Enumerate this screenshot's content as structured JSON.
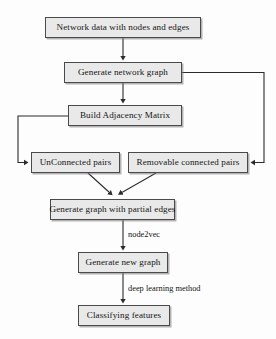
{
  "diagram": {
    "background_color": "#fdfdfd",
    "box_fill_color": "#e9e9e9",
    "box_border_color": "#4a4a4a",
    "connector_color": "#2b2b2b",
    "nodes": [
      {
        "id": "network-data",
        "label": "Network data with nodes and edges"
      },
      {
        "id": "generate-network",
        "label": "Generate network graph"
      },
      {
        "id": "build-adjacency",
        "label": "Build Adjacency Matrix"
      },
      {
        "id": "unconnected",
        "label": "UnConnected pairs"
      },
      {
        "id": "removable",
        "label": "Removable connected pairs"
      },
      {
        "id": "partial-edges",
        "label": "Generate graph with partial edges"
      },
      {
        "id": "new-graph",
        "label": "Generate new graph"
      },
      {
        "id": "classifying",
        "label": "Classifying features"
      }
    ],
    "edge_labels": [
      {
        "id": "node2vec",
        "label": "node2vec"
      },
      {
        "id": "deep-learning",
        "label": "deep learning method"
      }
    ],
    "edges": [
      {
        "from": "network-data",
        "to": "generate-network",
        "label": ""
      },
      {
        "from": "generate-network",
        "to": "build-adjacency",
        "label": ""
      },
      {
        "from": "build-adjacency",
        "to": "unconnected",
        "label": ""
      },
      {
        "from": "generate-network",
        "to": "removable",
        "label": ""
      },
      {
        "from": "unconnected",
        "to": "partial-edges",
        "label": ""
      },
      {
        "from": "removable",
        "to": "partial-edges",
        "label": ""
      },
      {
        "from": "partial-edges",
        "to": "new-graph",
        "label": "node2vec"
      },
      {
        "from": "new-graph",
        "to": "classifying",
        "label": "deep learning method"
      }
    ]
  }
}
